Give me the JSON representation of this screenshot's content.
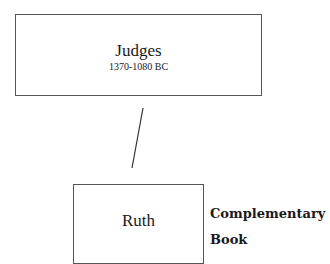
{
  "nodes": {
    "judges": {
      "title": "Judges",
      "subtitle": "1370-1080 BC"
    },
    "ruth": {
      "title": "Ruth"
    }
  },
  "annotation": {
    "line1": "Complementary",
    "line2": "Book"
  },
  "connector": {
    "from": "Judges",
    "to": "Ruth",
    "stroke": "#333333"
  },
  "colors": {
    "border": "#555555",
    "text": "#1a1a1a",
    "background": "#ffffff"
  }
}
